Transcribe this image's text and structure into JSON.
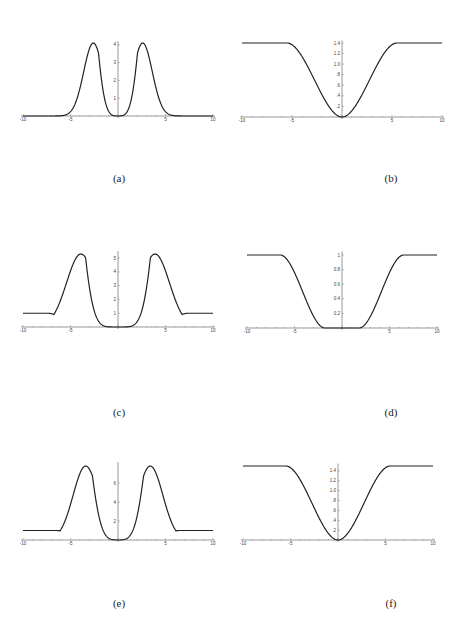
{
  "chart_data": [
    {
      "id": "a",
      "caption": "(a)",
      "type": "line",
      "xlim": [
        -10,
        10
      ],
      "ylim": [
        0,
        4.2
      ],
      "xticks": [
        -10,
        -5,
        5,
        10
      ],
      "yticks": [
        1,
        2,
        3,
        4
      ],
      "shape": "double-peak",
      "baseline": 0,
      "peak": 4.1,
      "peak_x": 2.6,
      "center_value": 0,
      "description": "Two symmetric peaks at x≈±2.6, height≈4.1, zero at origin, decays to 0 for |x|>5"
    },
    {
      "id": "b",
      "caption": "(b)",
      "type": "line",
      "xlim": [
        -10,
        10
      ],
      "ylim": [
        0,
        1.45
      ],
      "xticks": [
        -10,
        -5,
        5,
        10
      ],
      "yticks": [
        0.2,
        0.4,
        0.6,
        0.8,
        1.0,
        1.2,
        1.4
      ],
      "ytick_labels": [
        ".2",
        ".4",
        ".6",
        ".8",
        "1.0",
        "1.2",
        "1.4"
      ],
      "shape": "well",
      "plateau": 1.4,
      "center_value": 0,
      "plateau_x": 5.5,
      "description": "Well shape: 0 at origin rising to plateau ≈1.4 for |x|>5.5"
    },
    {
      "id": "c",
      "caption": "(c)",
      "type": "line",
      "xlim": [
        -10,
        10
      ],
      "ylim": [
        0,
        5.5
      ],
      "xticks": [
        -10,
        -5,
        5,
        10
      ],
      "yticks": [
        1,
        2,
        3,
        4,
        5
      ],
      "shape": "double-peak",
      "baseline": 1,
      "peak": 5.3,
      "peak_x": 3.9,
      "center_value": 0,
      "description": "Two peaks at x≈±3.9, height≈5.3, flat ≈0 near origin, baseline ≈1 for |x|>6.5"
    },
    {
      "id": "d",
      "caption": "(d)",
      "type": "line",
      "xlim": [
        -10,
        10
      ],
      "ylim": [
        0,
        1.05
      ],
      "xticks": [
        -10,
        -5,
        5,
        10
      ],
      "yticks": [
        0.2,
        0.4,
        0.6,
        0.8,
        1
      ],
      "ytick_labels": [
        "0.2",
        "0.4",
        "0.6",
        "0.8",
        "1"
      ],
      "shape": "flat-well",
      "plateau": 1,
      "center_value": 0,
      "plateau_x": 6.5,
      "description": "Flat bottom at 0 for |x|<2, rising to plateau 1 for |x|>6.5"
    },
    {
      "id": "e",
      "caption": "(e)",
      "type": "line",
      "xlim": [
        -10,
        10
      ],
      "ylim": [
        0,
        8.2
      ],
      "xticks": [
        -10,
        -5,
        5,
        10
      ],
      "yticks": [
        2,
        4,
        6
      ],
      "shape": "double-peak",
      "baseline": 1,
      "peak": 7.8,
      "peak_x": 3.4,
      "center_value": 0,
      "description": "Two peaks at x≈±3.4, height≈7.8, zero at origin, baseline ≈1 for |x|>6.5"
    },
    {
      "id": "f",
      "caption": "(f)",
      "type": "line",
      "xlim": [
        -10,
        10
      ],
      "ylim": [
        0,
        1.55
      ],
      "xticks": [
        -10,
        -5,
        5,
        10
      ],
      "yticks": [
        0.2,
        0.4,
        0.6,
        0.8,
        1.0,
        1.2,
        1.4
      ],
      "ytick_labels": [
        ".2",
        ".4",
        ".6",
        ".8",
        "1.0",
        "1.2",
        "1.4"
      ],
      "shape": "well",
      "plateau": 1.5,
      "center_value": 0,
      "plateau_x": 5.5,
      "description": "Well shape: 0 at origin rising to plateau ≈1.5 for |x|>5.5"
    }
  ],
  "panels": [
    {
      "id": "a",
      "left": 12,
      "top": 10,
      "axisY": 116,
      "cx": 118,
      "halfW": 95,
      "topY": 43,
      "captionX": 104,
      "captionY": 172
    },
    {
      "id": "b",
      "left": 0,
      "top": 0,
      "axisY": 117,
      "cx": 342,
      "halfW": 100,
      "topY": 43,
      "captionX": 376,
      "captionY": 172
    },
    {
      "id": "c",
      "left": 0,
      "top": 0,
      "axisY": 327,
      "cx": 118,
      "halfW": 95,
      "topY": 254,
      "captionX": 104,
      "captionY": 406
    },
    {
      "id": "d",
      "left": 0,
      "top": 0,
      "axisY": 328,
      "cx": 342,
      "halfW": 95,
      "topY": 255,
      "captionX": 376,
      "captionY": 406
    },
    {
      "id": "e",
      "left": 0,
      "top": 0,
      "axisY": 540,
      "cx": 118,
      "halfW": 95,
      "topY": 466,
      "captionX": 104,
      "captionY": 597
    },
    {
      "id": "f",
      "left": 0,
      "top": 0,
      "axisY": 540,
      "cx": 338,
      "halfW": 95,
      "topY": 466,
      "captionX": 376,
      "captionY": 597
    }
  ]
}
